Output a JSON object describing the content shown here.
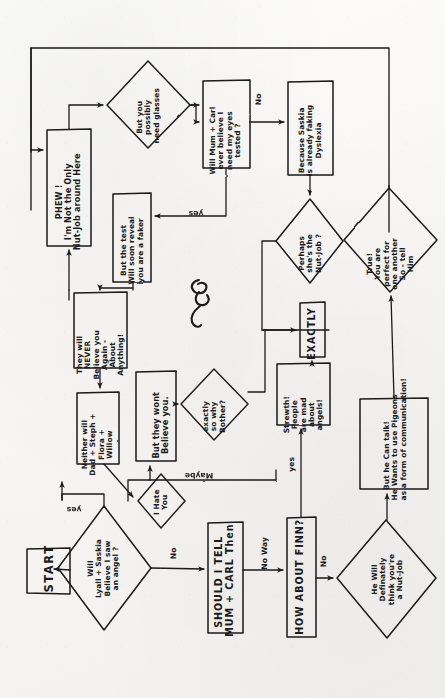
{
  "page": {
    "kind": "hand-drawn-flowchart",
    "orientation": "rotated-90-ccw",
    "ink_color": "#1b1b1b",
    "paper_color": "#f7f6f4"
  },
  "nodes": {
    "start": {
      "shape": "terminator",
      "text": "START"
    },
    "q_lyall_saskia": {
      "shape": "decision",
      "text": "Will\nLyall + Saskia\nBelieve I saw\nan angel ?"
    },
    "i_hate_you": {
      "shape": "decision",
      "text": "I Hate\nYou"
    },
    "b_tell_mum_carl": {
      "shape": "process",
      "text": "SHOULD I TELL\nMUM + CARL Then"
    },
    "b_how_about_finn": {
      "shape": "process",
      "text": "HOW ABOUT FINN?"
    },
    "q_finn_nutjob": {
      "shape": "decision",
      "text": "He Will\nDefinately\nthink you're\na Nut-Job"
    },
    "b_pigeons": {
      "shape": "process",
      "text": "But he Can talk!\nHe Wants to use Pigeons\nas a form of communication!"
    },
    "q_perfect": {
      "shape": "decision",
      "text": "True!\nYou are\nperfect for\none another\nSo - tell\nHim"
    },
    "b_strewth": {
      "shape": "process",
      "text": "Strewth!\nPeople\nare mad\nabout\nangels!"
    },
    "b_exactly": {
      "shape": "process",
      "text": "EXACTLY"
    },
    "q_why_bother": {
      "shape": "decision",
      "text": "exactly\nso why\nBother?"
    },
    "b_wont_believe": {
      "shape": "process",
      "text": "But they wont\nBelieve you."
    },
    "b_neither_will": {
      "shape": "process",
      "text": "Neither will\nDad + Steph +\nFlora +\nWillow"
    },
    "b_never_believe": {
      "shape": "process",
      "text": "They will\nNEVER\nBelieve you\nAgain -\nAbout\nAnything!"
    },
    "b_test_faker": {
      "shape": "process",
      "text": "But the test\nWill soon reveal\nyou are a faker"
    },
    "b_phew": {
      "shape": "process",
      "text": "PHEW !\nI'm Not the Only\nNut-Job around Here"
    },
    "q_need_glasses": {
      "shape": "decision",
      "text": "But you\npossibly\nneed glasses"
    },
    "b_eyes_tested": {
      "shape": "process",
      "text": "Will Mum + Carl\never believe I\nneed my eyes\ntested ?"
    },
    "b_saskia_dyslexia": {
      "shape": "process",
      "text": "Because Saskia\nis already faking\nDyslexia"
    },
    "q_perhaps_she": {
      "shape": "decision",
      "text": "Perhaps\nshe's the\nNut-Job ?"
    }
  },
  "edges": [
    {
      "id": "e-start-lyall",
      "from": "start",
      "to": "q_lyall_saskia",
      "label": ""
    },
    {
      "id": "e-lyall-yes",
      "from": "q_lyall_saskia",
      "to": "i_hate_you",
      "label": "yes"
    },
    {
      "id": "e-lyall-no",
      "from": "q_lyall_saskia",
      "to": "b_tell_mum_carl",
      "label": "No"
    },
    {
      "id": "e-mumcarl-noway",
      "from": "b_tell_mum_carl",
      "to": "b_how_about_finn",
      "label": "No Way"
    },
    {
      "id": "e-finn-no",
      "from": "b_how_about_finn",
      "to": "q_finn_nutjob",
      "label": "No"
    },
    {
      "id": "e-finn-yes",
      "from": "b_how_about_finn",
      "to": "b_strewth",
      "label": "yes"
    },
    {
      "id": "e-nutjob-pigeons",
      "from": "q_finn_nutjob",
      "to": "b_pigeons",
      "label": ""
    },
    {
      "id": "e-pigeons-perfect",
      "from": "b_pigeons",
      "to": "q_perfect",
      "label": ""
    },
    {
      "id": "e-strewth-exactly",
      "from": "b_strewth",
      "to": "b_exactly",
      "label": ""
    },
    {
      "id": "e-bother-exactly",
      "from": "q_why_bother",
      "to": "b_exactly",
      "label": ""
    },
    {
      "id": "e-wont-bother",
      "from": "b_wont_believe",
      "to": "q_why_bother",
      "label": ""
    },
    {
      "id": "e-maybe-wont",
      "from": "i_hate_you",
      "to": "b_wont_believe",
      "label": "Maybe"
    },
    {
      "id": "e-neither-down",
      "from": "b_neither_will",
      "to": "i_hate_you",
      "label": ""
    },
    {
      "id": "e-never-neither",
      "from": "b_never_believe",
      "to": "b_neither_will",
      "label": ""
    },
    {
      "id": "e-test-never",
      "from": "b_test_faker",
      "to": "b_never_believe",
      "label": ""
    },
    {
      "id": "e-phew-up",
      "from": "b_phew",
      "to": "q_need_glasses",
      "label": ""
    },
    {
      "id": "e-glasses-eyes",
      "from": "q_need_glasses",
      "to": "b_eyes_tested",
      "label": "No"
    },
    {
      "id": "e-eyes-test",
      "from": "b_eyes_tested",
      "to": "b_test_faker",
      "label": "yes"
    },
    {
      "id": "e-eyes-saskia",
      "from": "b_eyes_tested",
      "to": "b_saskia_dyslexia",
      "label": ""
    },
    {
      "id": "e-saskia-perhaps",
      "from": "b_saskia_dyslexia",
      "to": "q_perhaps_she",
      "label": ""
    },
    {
      "id": "e-perhaps-exactly",
      "from": "q_perhaps_she",
      "to": "b_exactly",
      "label": ""
    },
    {
      "id": "e-perfect-loop",
      "from": "q_perfect",
      "to": "b_phew",
      "label": ""
    },
    {
      "id": "e-neither-phew",
      "from": "b_neither_will",
      "to": "b_phew",
      "label": ""
    }
  ],
  "edge_labels": {
    "yes_from_lyall": "yes",
    "no_from_lyall": "No",
    "no_way": "No Way",
    "no_from_finn": "No",
    "yes_to_strewth": "yes",
    "maybe": "Maybe",
    "no_from_glasses": "No",
    "yes_from_eyes": "yes"
  },
  "decoration": {
    "doodle": "squiggle-curl"
  }
}
